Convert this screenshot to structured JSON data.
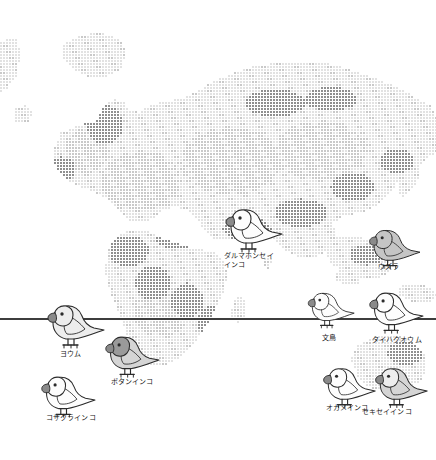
{
  "figure": {
    "type": "illustrated-distribution-map",
    "background_color": "#ffffff",
    "dot_color_light": "#e2e2e2",
    "dot_color_mid": "#c9c9c9",
    "dot_color_dark": "#8f8f8f",
    "equator_color": "#3d3d3d",
    "outline_color": "#2b2b2b",
    "bird_fill_light": "#fdfdfd",
    "bird_fill_gray": "#c5c5c5",
    "bird_fill_midgray": "#9a9a9a"
  },
  "equator": {
    "label": "equator-line",
    "y": 318
  },
  "birds": [
    {
      "id": "daruma-honsei-inko",
      "label_line1": "ダルマホンセイ",
      "label_line2": "インコ",
      "common_name_en": "Alexandrine parakeet",
      "x": 222,
      "y": 196,
      "label_x": 224,
      "label_y": 252,
      "scale": 1.0,
      "body_fill": "#fdfdfd",
      "head_fill": "#fdfdfd",
      "facing": "left"
    },
    {
      "id": "uzura",
      "label_line1": "ウズラ",
      "label_line2": "",
      "common_name_en": "Japanese quail",
      "x": 366,
      "y": 218,
      "label_x": 378,
      "label_y": 263,
      "scale": 0.9,
      "body_fill": "#c5c5c5",
      "head_fill": "#c5c5c5",
      "facing": "left"
    },
    {
      "id": "youmu",
      "label_line1": "ヨウム",
      "label_line2": "",
      "common_name_en": "African grey parrot",
      "x": 44,
      "y": 292,
      "label_x": 60,
      "label_y": 350,
      "scale": 1.0,
      "body_fill": "#ededed",
      "head_fill": "#ededed",
      "facing": "left"
    },
    {
      "id": "botan-inko",
      "label_line1": "ボタンインコ",
      "label_line2": "",
      "common_name_en": "Lovebird",
      "x": 102,
      "y": 324,
      "label_x": 111,
      "label_y": 378,
      "scale": 0.95,
      "body_fill": "#d5d5d5",
      "head_fill": "#9a9a9a",
      "facing": "left"
    },
    {
      "id": "kozakura-inko",
      "label_line1": "コザクラインコ",
      "label_line2": "",
      "common_name_en": "Peach-faced lovebird",
      "x": 38,
      "y": 364,
      "label_x": 46,
      "label_y": 414,
      "scale": 0.95,
      "body_fill": "#fdfdfd",
      "head_fill": "#fdfdfd",
      "facing": "left"
    },
    {
      "id": "bunchou",
      "label_line1": "文鳥",
      "label_line2": "",
      "common_name_en": "Java sparrow",
      "x": 305,
      "y": 282,
      "label_x": 322,
      "label_y": 334,
      "scale": 0.82,
      "body_fill": "#fdfdfd",
      "head_fill": "#fdfdfd",
      "facing": "left"
    },
    {
      "id": "taihaku-oumu",
      "label_line1": "タイハクオウム",
      "label_line2": "",
      "common_name_en": "Umbrella cockatoo",
      "x": 366,
      "y": 280,
      "label_x": 372,
      "label_y": 336,
      "scale": 0.95,
      "body_fill": "#fdfdfd",
      "head_fill": "#fdfdfd",
      "facing": "left"
    },
    {
      "id": "okame-inko",
      "label_line1": "オカメインコ",
      "label_line2": "",
      "common_name_en": "Cockatiel",
      "x": 320,
      "y": 356,
      "label_x": 326,
      "label_y": 404,
      "scale": 0.92,
      "body_fill": "#fdfdfd",
      "head_fill": "#fdfdfd",
      "facing": "left"
    },
    {
      "id": "sekisei-inko",
      "label_line1": "セキセイインコ",
      "label_line2": "",
      "common_name_en": "Budgerigar",
      "x": 372,
      "y": 356,
      "label_x": 362,
      "label_y": 408,
      "scale": 0.92,
      "body_fill": "#d5d5d5",
      "head_fill": "#ededed",
      "facing": "left"
    }
  ]
}
